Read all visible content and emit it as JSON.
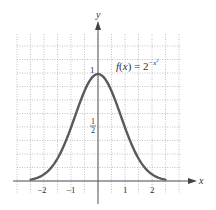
{
  "chart_data": {
    "type": "line",
    "title": "",
    "annotation": "f(x) = 2^(-x^2)",
    "function": "2^(-x^2)",
    "xlabel": "x",
    "ylabel": "y",
    "xlim": [
      -2.6,
      2.6
    ],
    "ylim": [
      0,
      1.25
    ],
    "grid": true,
    "grid_step_x": 0.5,
    "grid_step_y": 0.125,
    "x_ticks": [
      -2,
      -1,
      1,
      2
    ],
    "x_tick_labels": [
      "−2",
      "−1",
      "1",
      "2"
    ],
    "y_ticks": [
      0.5,
      1
    ],
    "y_tick_labels": [
      "1/2",
      "1"
    ],
    "series": [
      {
        "name": "f(x) = 2^(-x^2)",
        "color": "#5a5a5a",
        "x": [
          -2.5,
          -2,
          -1.5,
          -1,
          -0.5,
          0,
          0.5,
          1,
          1.5,
          2,
          2.5
        ],
        "values": [
          0.0133,
          0.0625,
          0.2102,
          0.5,
          0.8409,
          1,
          0.8409,
          0.5,
          0.2102,
          0.0625,
          0.0133
        ]
      }
    ],
    "legend": "none"
  },
  "labels": {
    "x_axis": "x",
    "y_axis": "y",
    "formula_prefix": "f",
    "formula_open": "(",
    "formula_var": "x",
    "formula_close": ") = 2",
    "formula_exp": "−x",
    "formula_exp_pow": "2",
    "y_one": "1",
    "y_half_num": "1",
    "y_half_den": "2",
    "tick_m2": "−2",
    "tick_m1": "−1",
    "tick_1": "1",
    "tick_2": "2"
  },
  "colors": {
    "curve": "#5a5a5a",
    "axis": "#555555",
    "grid": "#9a9a9a"
  }
}
